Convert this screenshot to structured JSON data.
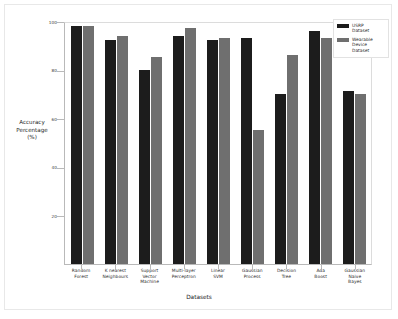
{
  "chart_data": {
    "type": "bar",
    "title": "",
    "xlabel": "Datasets",
    "ylabel": "Accuracy Percentage (%)",
    "ylim": [
      0,
      100
    ],
    "yticks": [
      20,
      40,
      60,
      80,
      100
    ],
    "grid": false,
    "legend_position": "top-right",
    "categories": [
      "Random Forest",
      "K nearest Neighbours",
      "Support Vector Machine",
      "Multi-layer Perceptron",
      "Linear SVM",
      "Gaussian Process",
      "Decision Tree",
      "Ada Boost",
      "Gaussian Naive Bayes"
    ],
    "category_lines": [
      [
        "Random",
        "Forest"
      ],
      [
        "K nearest",
        "Neighbours"
      ],
      [
        "Support",
        "Vector",
        "Machine"
      ],
      [
        "Multi-layer",
        "Perceptron"
      ],
      [
        "Linear",
        "SVM"
      ],
      [
        "Gaussian",
        "Process"
      ],
      [
        "Decision",
        "Tree"
      ],
      [
        "Ada",
        "Boost"
      ],
      [
        "Gaussian",
        "Naive",
        "Bayes"
      ]
    ],
    "series": [
      {
        "name": "USRP Dataset",
        "color": "#1c1c1c",
        "values": [
          98,
          92,
          80,
          94,
          92,
          93,
          70,
          96,
          71
        ]
      },
      {
        "name": "Wearable Device Dataset",
        "color": "#6f6f6f",
        "values": [
          98,
          94,
          85,
          97,
          93,
          55,
          86,
          93,
          70
        ]
      }
    ]
  },
  "legend": {
    "items": [
      {
        "label_lines": [
          "USRP",
          "Dataset"
        ],
        "color": "#1c1c1c"
      },
      {
        "label_lines": [
          "Wearable",
          "Device",
          "Dataset"
        ],
        "color": "#6f6f6f"
      }
    ]
  },
  "axis": {
    "y_title_lines": [
      "Accuracy",
      "Percentage",
      "(%)"
    ],
    "x_title": "Datasets"
  }
}
